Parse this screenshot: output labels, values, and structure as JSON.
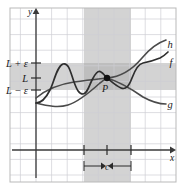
{
  "figure": {
    "background_color": "#ffffff",
    "frame_color": "#b9b9b9",
    "grid_color": "#cfcfd4",
    "axis_color": "#3a3a3a",
    "curve_color": "#4a4a4a",
    "band_color": "#c9c9c9",
    "band_overlap_color": "#b0b0b0"
  },
  "axes": {
    "x_label": "x",
    "y_label": "y",
    "x_axis_y_px": 150,
    "y_axis_x_px": 36,
    "grid_spacing_px": 15.6,
    "frame": {
      "left": 10,
      "top": 8,
      "right": 176,
      "bottom": 182
    }
  },
  "y_ticks": [
    {
      "label": "L + ε",
      "y_px": 63
    },
    {
      "label": "L",
      "y_px": 78
    },
    {
      "label": "L − ε",
      "y_px": 90
    }
  ],
  "x_ticks": [
    {
      "label": "",
      "x_px": 84
    },
    {
      "label": "",
      "x_px": 107
    },
    {
      "label": "",
      "x_px": 131
    }
  ],
  "bands": {
    "horizontal": {
      "y_top_px": 63,
      "y_bottom_px": 90,
      "meaning": "L minus epsilon to L plus epsilon"
    },
    "vertical": {
      "x_left_px": 84,
      "x_right_px": 131,
      "meaning": "delta neighborhood of c"
    }
  },
  "point": {
    "name": "P",
    "label": "P",
    "x_px": 107,
    "y_px": 78
  },
  "delta_annotation": {
    "label": "c",
    "arrow_left_x_px": 86,
    "arrow_right_x_px": 129,
    "y_px": 166
  },
  "curves": [
    {
      "name": "h",
      "label": "h",
      "label_x_px": 171,
      "label_y_px": 45,
      "role": "upper-bound"
    },
    {
      "name": "f",
      "label": "f",
      "label_x_px": 172,
      "label_y_px": 63,
      "role": "squeezed-oscillating"
    },
    {
      "name": "g",
      "label": "g",
      "label_x_px": 171,
      "label_y_px": 105,
      "role": "lower-bound"
    }
  ],
  "chart_data": {
    "type": "line",
    "title": "",
    "xlabel": "x",
    "ylabel": "y",
    "grid": true,
    "legend": "inline-curve-labels",
    "annotations": [
      {
        "text": "L + ε",
        "type": "y-tick"
      },
      {
        "text": "L",
        "type": "y-tick"
      },
      {
        "text": "L − ε",
        "type": "y-tick"
      },
      {
        "text": "P",
        "type": "point-label"
      },
      {
        "text": "c",
        "type": "x-annotation"
      }
    ],
    "series": [
      {
        "name": "h",
        "path": "M 36,98 C 48,88 60,84 74,82 C 88,80 98,79 107,78 C 120,77 132,70 142,58 C 152,46 160,42 166,40"
      },
      {
        "name": "f",
        "path": "M 36,103 C 42,103 46,98 50,90 C 54,82 57,66 63,64 C 69,62 71,74 74,82 C 77,90 79,94 83,94 C 87,94 89,86 92,80 C 95,74 98,70 101,72 C 103,73 105,76 107,78 C 112,82 116,86 121,88 C 126,90 129,86 132,78 C 135,70 138,64 143,63 C 149,62 155,60 160,58 C 164,56 166,54 168,52"
      },
      {
        "name": "g",
        "path": "M 36,103 C 48,106 58,108 68,105 C 78,102 90,92 100,83 C 103,81 105,79 107,78 C 120,82 133,90 143,97 C 152,102 160,104 166,104"
      }
    ]
  }
}
